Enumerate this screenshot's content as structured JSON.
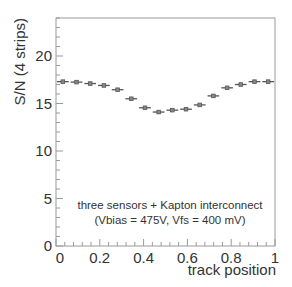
{
  "chart_data": {
    "type": "scatter",
    "title": "",
    "xlabel": "track position",
    "ylabel": "S/N (4 strips)",
    "xlim": [
      0,
      1
    ],
    "ylim": [
      0,
      24
    ],
    "grid": false,
    "x_ticks": [
      0,
      0.2,
      0.4,
      0.6,
      0.8,
      1
    ],
    "x_tick_labels": [
      "0",
      "0.2",
      "0.4",
      "0.6",
      "0.8",
      "1"
    ],
    "y_ticks": [
      0,
      5,
      10,
      15,
      20
    ],
    "y_tick_labels": [
      "0",
      "5",
      "10",
      "15",
      "20"
    ],
    "bin_width": 0.0625,
    "series": [
      {
        "name": "S/N vs track position",
        "x": [
          0.03125,
          0.09375,
          0.15625,
          0.21875,
          0.28125,
          0.34375,
          0.40625,
          0.46875,
          0.53125,
          0.59375,
          0.65625,
          0.71875,
          0.78125,
          0.84375,
          0.90625,
          0.96875
        ],
        "values": [
          17.3,
          17.25,
          17.1,
          16.9,
          16.45,
          15.5,
          14.55,
          14.1,
          14.3,
          14.4,
          14.85,
          15.8,
          16.65,
          17.0,
          17.3,
          17.3
        ]
      }
    ],
    "annotations": [
      "three sensors + Kapton interconnect",
      "(Vbias = 475V, Vfs = 400 mV)"
    ]
  },
  "colors": {
    "frame": "#9a9a9a",
    "marker": "#555555",
    "text": "#333333"
  }
}
